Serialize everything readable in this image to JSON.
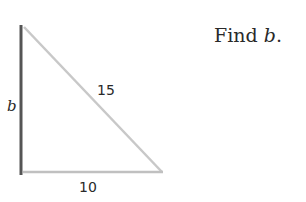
{
  "problem": {
    "prompt_prefix": "Find ",
    "prompt_var": "b",
    "prompt_suffix": "."
  },
  "triangle": {
    "vertical_leg_label": "b",
    "hypotenuse_label": "15",
    "base_label": "10",
    "colors": {
      "vertical_leg": "#555555",
      "hypotenuse": "#c8c8c8",
      "base": "#c0c0c0"
    }
  }
}
